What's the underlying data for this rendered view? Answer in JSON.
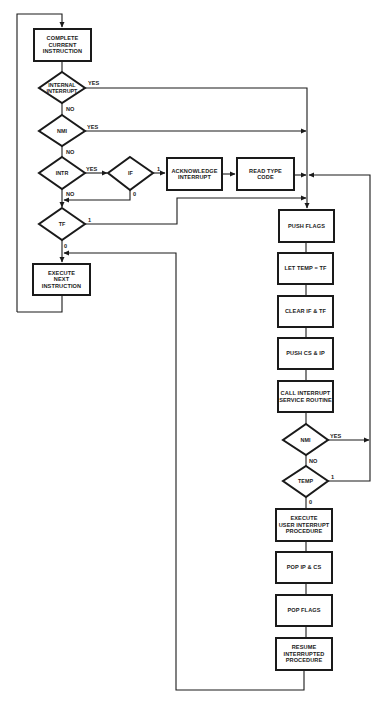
{
  "diagram": {
    "type": "flowchart",
    "boxes": {
      "complete_current": "COMPLETE\nCURRENT\nINSTRUCTION",
      "acknowledge": "ACKNOWLEDGE\nINTERRUPT",
      "read_type": "READ TYPE\nCODE",
      "execute_next": "EXECUTE\nNEXT\nINSTRUCTION",
      "push_flags": "PUSH FLAGS",
      "let_temp": "LET TEMP = TF",
      "clear_if_tf": "CLEAR IF & TF",
      "push_cs_ip": "PUSH CS & IP",
      "call_isr": "CALL INTERRUPT\nSERVICE ROUTINE",
      "execute_user": "EXECUTE\nUSER INTERRUPT\nPROCEDURE",
      "pop_ip_cs": "POP IP & CS",
      "pop_flags": "POP FLAGS",
      "resume": "RESUME\nINTERRUPTED\nPROCEDURE"
    },
    "decisions": {
      "internal_interrupt": "INTERNAL\nINTERRUPT",
      "nmi_1": "NMI",
      "intr": "INTR",
      "if": "IF",
      "tf": "TF",
      "nmi_2": "NMI",
      "temp": "TEMP"
    },
    "edge_labels": {
      "internal_yes": "YES",
      "internal_no": "NO",
      "nmi1_yes": "YES",
      "nmi1_no": "NO",
      "intr_yes": "YES",
      "intr_no": "NO",
      "if_one": "1",
      "if_zero": "0",
      "tf_one": "1",
      "tf_zero": "0",
      "nmi2_yes": "YES",
      "nmi2_no": "NO",
      "temp_one": "1",
      "temp_zero": "0"
    },
    "colors": {
      "line": "#1a1a1a",
      "background": "#ffffff"
    }
  }
}
